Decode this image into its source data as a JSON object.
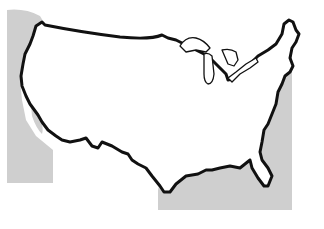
{
  "map": {
    "title": "Outline map of the contiguous United States",
    "subject": "contiguous-united-states",
    "features": [
      {
        "name": "national-border-outline",
        "style": "thick black line"
      },
      {
        "name": "great-lakes",
        "style": "thin black outline"
      },
      {
        "name": "offset-shadow-region",
        "style": "light gray fill"
      }
    ],
    "colors": {
      "background": "#ffffff",
      "outline": "#111111",
      "shade": "#cfcfcf",
      "land": "#ffffff"
    }
  }
}
